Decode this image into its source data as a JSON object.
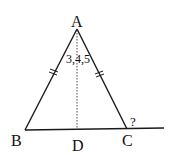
{
  "diagram": {
    "type": "geometry",
    "vertices": {
      "A": {
        "label": "A"
      },
      "B": {
        "label": "B"
      },
      "C": {
        "label": "C"
      },
      "D": {
        "label": "D"
      }
    },
    "angle_label": "3,4,5",
    "unknown_label": "?",
    "colors": {
      "stroke": "#1a1a1a",
      "background": "#ffffff"
    }
  }
}
